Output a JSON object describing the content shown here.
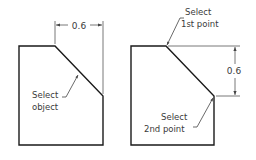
{
  "figures": [
    {
      "id": "left",
      "dimension_label": "0.6",
      "dimension_orientation": "horizontal",
      "callout": [
        "Select",
        "object"
      ]
    },
    {
      "id": "right",
      "dimension_label": "0.6",
      "dimension_orientation": "vertical",
      "callout_top": [
        "Select",
        "1st point"
      ],
      "callout_bottom": [
        "Select",
        "2nd point"
      ]
    }
  ],
  "colors": {
    "outline": "#1a1a1a",
    "dimension": "#555555",
    "text": "#3a3a3a"
  }
}
